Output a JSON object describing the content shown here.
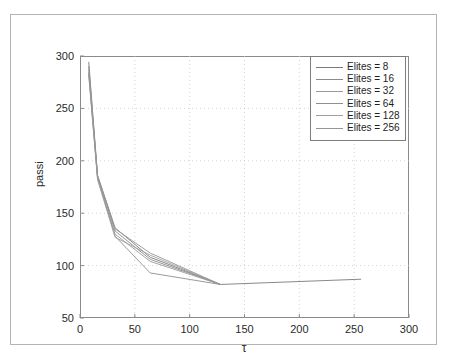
{
  "figure": {
    "background_color": "#ffffff",
    "frame_color": "#b4b4b4",
    "axis_color": "#8a8a8a",
    "grid_color": "#c8c8c8",
    "text_color": "#2a2a2a"
  },
  "chart_data": {
    "type": "line",
    "title": "",
    "xlabel": "τ",
    "ylabel": "passi",
    "xlim": [
      0,
      300
    ],
    "ylim": [
      50,
      300
    ],
    "xticks": [
      0,
      50,
      100,
      150,
      200,
      250,
      300
    ],
    "yticks": [
      50,
      100,
      150,
      200,
      250,
      300
    ],
    "xtick_labels": [
      "0",
      "50",
      "100",
      "150",
      "200",
      "250",
      "300"
    ],
    "ytick_labels": [
      "50",
      "100",
      "150",
      "200",
      "250",
      "300"
    ],
    "grid": true,
    "grid_style": "dotted",
    "legend_position": "top-right",
    "series": [
      {
        "name": "Elites = 8",
        "color": "#7a7a7a",
        "x": [
          8,
          16,
          32,
          64,
          128,
          256
        ],
        "y": [
          294,
          186,
          136,
          108,
          82,
          87
        ]
      },
      {
        "name": "Elites = 16",
        "color": "#8a8a8a",
        "x": [
          8,
          16,
          32,
          64,
          128
        ],
        "y": [
          290,
          185,
          133,
          106,
          82
        ]
      },
      {
        "name": "Elites = 32",
        "color": "#9a9a9a",
        "x": [
          8,
          16,
          32,
          64,
          128
        ],
        "y": [
          287,
          184,
          130,
          104,
          82
        ]
      },
      {
        "name": "Elites = 64",
        "color": "#8f8f8f",
        "x": [
          8,
          16,
          32,
          64,
          128
        ],
        "y": [
          284,
          183,
          128,
          93,
          82
        ]
      },
      {
        "name": "Elites = 128",
        "color": "#a0a0a0",
        "x": [
          8,
          16,
          32,
          64,
          128
        ],
        "y": [
          281,
          182,
          127,
          110,
          82
        ]
      },
      {
        "name": "Elites = 256",
        "color": "#959595",
        "x": [
          8,
          16,
          32,
          64,
          128
        ],
        "y": [
          283,
          186,
          135,
          112,
          82
        ]
      }
    ]
  },
  "legend": {
    "items": [
      {
        "label": "Elites = 8"
      },
      {
        "label": "Elites = 16"
      },
      {
        "label": "Elites = 32"
      },
      {
        "label": "Elites = 64"
      },
      {
        "label": "Elites = 128"
      },
      {
        "label": "Elites = 256"
      }
    ]
  }
}
